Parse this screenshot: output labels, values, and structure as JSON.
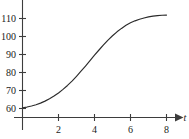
{
  "chart_data": {
    "type": "line",
    "title": "",
    "subtitle": "",
    "xlabel": "t",
    "ylabel": "",
    "xlim": [
      -0.35,
      9.0
    ],
    "ylim": [
      55.0,
      117.0
    ],
    "grid": false,
    "legend": null,
    "x_ticks": [
      2,
      4,
      6,
      8
    ],
    "x_tick_labels": [
      "2",
      "4",
      "6",
      "8"
    ],
    "y_ticks": [
      60,
      70,
      80,
      90,
      100,
      110
    ],
    "y_tick_labels": [
      "60",
      "70",
      "80",
      "90",
      "100",
      "110"
    ],
    "series": [
      {
        "name": "logistic growth",
        "x": [
          0.0,
          0.25,
          0.5,
          0.75,
          1.0,
          1.25,
          1.5,
          1.75,
          2.0,
          2.25,
          2.5,
          2.75,
          3.0,
          3.25,
          3.5,
          3.75,
          4.0,
          4.25,
          4.5,
          4.75,
          5.0,
          5.25,
          5.5,
          5.75,
          6.0,
          6.25,
          6.5,
          6.75,
          7.0,
          7.25,
          7.5,
          7.75,
          8.0
        ],
        "y": [
          60.4,
          60.8,
          61.4,
          62.1,
          63.0,
          64.1,
          65.4,
          66.9,
          68.6,
          70.6,
          72.8,
          75.2,
          77.9,
          80.7,
          83.6,
          86.6,
          89.6,
          92.5,
          95.3,
          98.0,
          100.4,
          102.6,
          104.5,
          106.2,
          107.6,
          108.7,
          109.6,
          110.3,
          110.9,
          111.3,
          111.6,
          111.8,
          111.9
        ]
      }
    ],
    "axis_arrow": "right",
    "curve_color": "#2b2b2b",
    "axis_color": "#3d3d3d"
  },
  "figure": {
    "background_color": "#ffffff",
    "width": 189,
    "height": 139
  }
}
